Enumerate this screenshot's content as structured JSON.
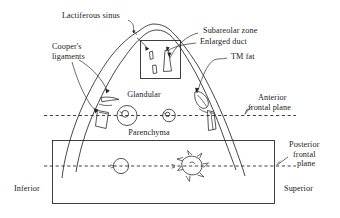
{
  "figure": {
    "background_color": "#ffffff",
    "ink_color": "#262626"
  },
  "labels": {
    "lactiferous_sinus": "Lactiferous sinus",
    "coopers_line1": "Cooper's",
    "coopers_line2": "ligaments",
    "subareolar_zone": "Subareolar zone",
    "enlarged_duct": "Enlarged duct",
    "tm_fat": "TM fat",
    "glandular": "Glandular",
    "parenchyma": "Parenchyma",
    "anterior_line1": "Anterior",
    "anterior_line2": "frontal plane",
    "posterior_line1": "Posterior",
    "posterior_line2": "frontal",
    "posterior_line3": "plane",
    "inferior": "Inferior",
    "superior": "Superior"
  },
  "structures": {
    "breast_outline": "peaked breast contour",
    "subareolar_box": "rectangle enclosing duct profiles",
    "chest_wall_box": "large lower rectangle",
    "anterior_frontal_plane": "upper horizontal dashed line",
    "posterior_frontal_plane": "lower horizontal dashed line",
    "glandular_nodule_large": "large circle with inner ring",
    "glandular_nodule_small": "small circle with inner ring",
    "posterior_circle": "plain circle on posterior plane",
    "spiculated_mass": "spiculated star-shaped mass",
    "cooper_ligament_upper": "hook-shaped ligament",
    "cooper_ligament_lower": "quadrilateral ligament",
    "tm_fat_left": "fat lobule left",
    "tm_fat_right": "fat lobule right",
    "duct_small": "small duct profile",
    "duct_large": "tapered duct profile",
    "duct_tiny": "tiny duct profile"
  }
}
